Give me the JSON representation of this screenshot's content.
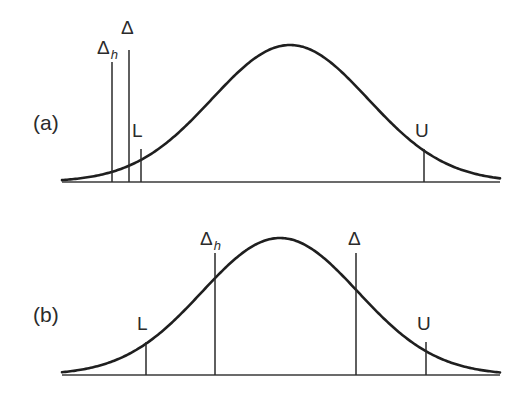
{
  "figure": {
    "width": 519,
    "height": 393,
    "background_color": "#ffffff",
    "curve_color": "#1f1f1f",
    "line_color": "#2a2a2a",
    "text_color": "#2b2b2b"
  },
  "panels": [
    {
      "id": "a",
      "label": "(a)",
      "label_x": 33,
      "label_y": 130,
      "baseline": {
        "x1": 62,
        "x2": 500,
        "y": 182
      },
      "curve": {
        "peak_x": 290,
        "peak_y": 45,
        "sigma": 78,
        "left_x": 62,
        "right_x": 500,
        "baseline_y": 182
      },
      "markers": [
        {
          "name": "delta-h",
          "label": "Δ",
          "sub": "h",
          "x": 112,
          "top_y": 62,
          "bottom_y": 182,
          "label_x": 97,
          "label_y": 54
        },
        {
          "name": "delta",
          "label": "Δ",
          "sub": "",
          "x": 129,
          "top_y": 50,
          "bottom_y": 182,
          "label_x": 121,
          "label_y": 34
        },
        {
          "name": "lower-bound",
          "label": "L",
          "sub": "",
          "x": 141,
          "top_y": 149,
          "bottom_y": 182,
          "label_x": 132,
          "label_y": 137
        },
        {
          "name": "upper-bound",
          "label": "U",
          "sub": "",
          "x": 424,
          "top_y": 149,
          "bottom_y": 182,
          "label_x": 415,
          "label_y": 137
        }
      ]
    },
    {
      "id": "b",
      "label": "(b)",
      "label_x": 33,
      "label_y": 322,
      "baseline": {
        "x1": 62,
        "x2": 500,
        "y": 375
      },
      "curve": {
        "peak_x": 280,
        "peak_y": 238,
        "sigma": 78,
        "left_x": 62,
        "right_x": 500,
        "baseline_y": 375
      },
      "markers": [
        {
          "name": "lower-bound",
          "label": "L",
          "sub": "",
          "x": 146,
          "top_y": 342,
          "bottom_y": 375,
          "label_x": 137,
          "label_y": 330
        },
        {
          "name": "delta-h",
          "label": "Δ",
          "sub": "h",
          "x": 215,
          "top_y": 253,
          "bottom_y": 375,
          "label_x": 200,
          "label_y": 245
        },
        {
          "name": "delta",
          "label": "Δ",
          "sub": "",
          "x": 356,
          "top_y": 253,
          "bottom_y": 375,
          "label_x": 348,
          "label_y": 245
        },
        {
          "name": "upper-bound",
          "label": "U",
          "sub": "",
          "x": 426,
          "top_y": 342,
          "bottom_y": 375,
          "label_x": 417,
          "label_y": 330
        }
      ]
    }
  ],
  "chart_data": {
    "type": "line",
    "title": "",
    "subtitle": "",
    "xlabel": "",
    "ylabel": "",
    "grid": false,
    "legend": "none",
    "panels": [
      {
        "name": "(a)",
        "series": [
          {
            "name": "gaussian",
            "kind": "gaussian",
            "mean": 290,
            "sigma": 78,
            "peak_height": 137,
            "x_range": [
              62,
              500
            ]
          }
        ],
        "annotations": [
          {
            "label": "Δh",
            "x": 112,
            "height": "tall",
            "note": "far left of distribution, in lower tail"
          },
          {
            "label": "Δ",
            "x": 129,
            "height": "tall",
            "note": "just right of Δh, still in lower tail"
          },
          {
            "label": "L",
            "x": 141,
            "height": "short",
            "note": "lower confidence limit"
          },
          {
            "label": "U",
            "x": 424,
            "height": "short",
            "note": "upper confidence limit"
          }
        ]
      },
      {
        "name": "(b)",
        "series": [
          {
            "name": "gaussian",
            "kind": "gaussian",
            "mean": 280,
            "sigma": 78,
            "peak_height": 137,
            "x_range": [
              62,
              500
            ]
          }
        ],
        "annotations": [
          {
            "label": "L",
            "x": 146,
            "height": "short",
            "note": "lower confidence limit"
          },
          {
            "label": "Δh",
            "x": 215,
            "height": "tall",
            "note": "left of the mean, inside the interval"
          },
          {
            "label": "Δ",
            "x": 356,
            "height": "tall",
            "note": "right of the mean, inside the interval"
          },
          {
            "label": "U",
            "x": 426,
            "height": "short",
            "note": "upper confidence limit"
          }
        ]
      }
    ]
  }
}
